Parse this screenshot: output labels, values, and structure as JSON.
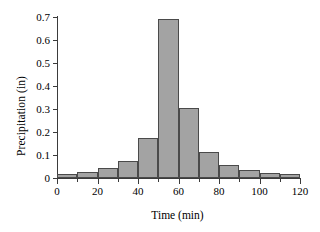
{
  "chart_data": {
    "type": "bar",
    "title": "",
    "xlabel": "Time (min)",
    "ylabel": "Precipitation (in)",
    "xlim": [
      0,
      120
    ],
    "ylim": [
      0,
      0.7
    ],
    "grid": false,
    "legend": null,
    "bin_width": 10,
    "bin_edges": [
      0,
      10,
      20,
      30,
      40,
      50,
      60,
      70,
      80,
      90,
      100,
      110,
      120
    ],
    "categories": [
      "0-10",
      "10-20",
      "20-30",
      "30-40",
      "40-50",
      "50-60",
      "60-70",
      "70-80",
      "80-90",
      "90-100",
      "100-110",
      "110-120"
    ],
    "values": [
      0.018,
      0.025,
      0.045,
      0.075,
      0.172,
      0.69,
      0.303,
      0.115,
      0.057,
      0.036,
      0.023,
      0.016
    ],
    "x_ticks": [
      0,
      20,
      40,
      60,
      80,
      100,
      120
    ],
    "x_tick_labels": [
      "0",
      "20",
      "40",
      "60",
      "80",
      "100",
      "120"
    ],
    "x_minor_ticks": [
      10,
      30,
      50,
      70,
      90,
      110
    ],
    "y_ticks": [
      0,
      0.1,
      0.2,
      0.3,
      0.4,
      0.5,
      0.6,
      0.7
    ],
    "y_tick_labels": [
      "0",
      "0.1",
      "0.2",
      "0.3",
      "0.4",
      "0.5",
      "0.6",
      "0.7"
    ],
    "bar_fill_color": "#a3a3a3",
    "bar_edge_color": "#4a4a4a",
    "axis_color": "#3b3b3b",
    "background_color": "#ffffff"
  }
}
